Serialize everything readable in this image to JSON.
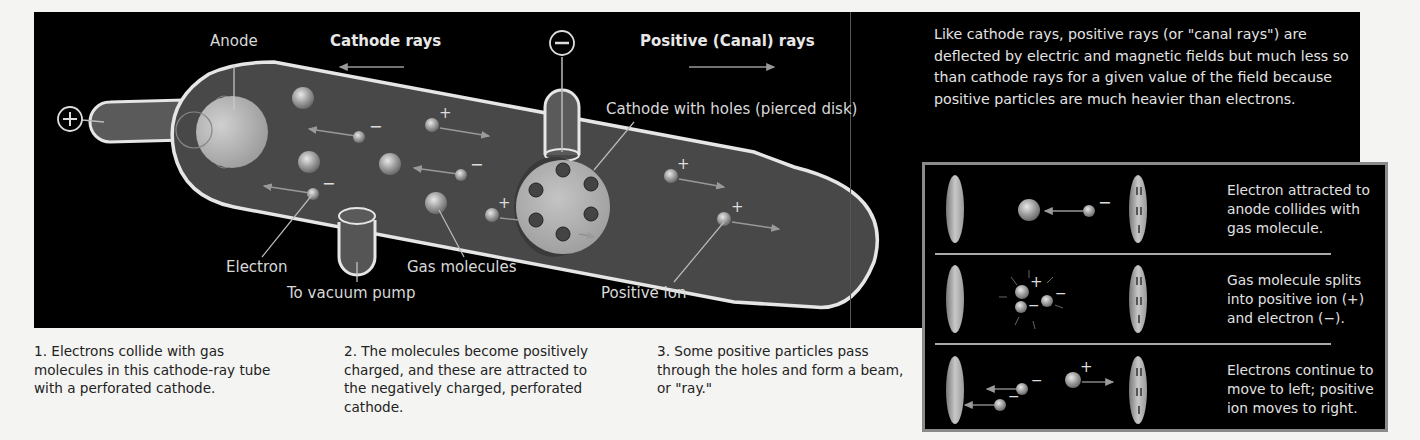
{
  "diagram": {
    "title_labels": {
      "anode": "Anode",
      "cathode_rays": "Cathode rays",
      "positive_rays": "Positive (Canal) rays",
      "cathode_with_holes": "Cathode with holes (pierced disk)",
      "electron": "Electron",
      "gas_molecules": "Gas molecules",
      "vacuum_pump": "To vacuum pump",
      "positive_ion": "Positive ion"
    },
    "terminals": {
      "positive": "+",
      "negative": "−"
    },
    "charges": {
      "plus": "+",
      "minus": "−"
    }
  },
  "info": {
    "text": "Like cathode rays, positive rays (or \"canal rays\") are deflected by electric and magnetic fields but much less so than cathode rays for a given value of the field because positive particles are much heavier than electrons."
  },
  "steps_box": {
    "rows": [
      {
        "text": "Electron attracted to anode collides with gas molecule."
      },
      {
        "text": "Gas molecule splits into positive ion (+) and electron (−)."
      },
      {
        "text": "Electrons continue to move to left; positive ion moves to right."
      }
    ]
  },
  "captions": [
    {
      "text": "1. Electrons collide with gas molecules in this cathode-ray tube with a perforated cathode."
    },
    {
      "text": "2. The molecules become positively charged, and these are attracted to the negatively charged, perforated cathode."
    },
    {
      "text": "3. Some positive particles pass through the holes and form a beam, or \"ray.\""
    }
  ],
  "colors": {
    "background": "#f4f4f2",
    "panel": "#000000",
    "tube_fill": "#4a4a4a",
    "tube_outline": "#e6e6e6",
    "sphere": "#b8b8b8",
    "box_border": "#8a8a8a"
  }
}
